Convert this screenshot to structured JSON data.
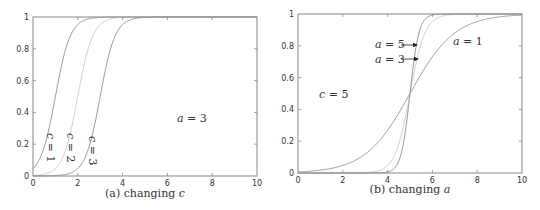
{
  "chart_data": [
    {
      "type": "line",
      "title": "",
      "caption": "(a) changing c",
      "caption_prefix": "(a) changing ",
      "caption_var": "c",
      "xlabel": "",
      "ylabel": "",
      "xlim": [
        0,
        10
      ],
      "ylim": [
        0,
        1
      ],
      "xticks": [
        "0",
        "2",
        "4",
        "6",
        "8",
        "10"
      ],
      "yticks": [
        "0",
        "0.2",
        "0.4",
        "0.6",
        "0.8",
        "1"
      ],
      "grid": false,
      "function": "1/(1+exp(-a*(x-c)))",
      "series": [
        {
          "name": "c = 1",
          "a": 3,
          "c": 1,
          "color": "#9a9a9a"
        },
        {
          "name": "c = 2",
          "a": 3,
          "c": 2,
          "color": "#d0d0d0"
        },
        {
          "name": "c = 3",
          "a": 3,
          "c": 3,
          "color": "#9a9a9a"
        }
      ],
      "annotations": [
        {
          "text": "c = 1",
          "rotated": true
        },
        {
          "text": "c = 2",
          "rotated": true
        },
        {
          "text": "c = 3",
          "rotated": true
        },
        {
          "text": "a = 3",
          "rotated": false
        }
      ]
    },
    {
      "type": "line",
      "title": "",
      "caption": "(b) changing a",
      "caption_prefix": "(b) changing ",
      "caption_var": "a",
      "xlabel": "",
      "ylabel": "",
      "xlim": [
        0,
        10
      ],
      "ylim": [
        0,
        1
      ],
      "xticks": [
        "0",
        "2",
        "4",
        "6",
        "8",
        "10"
      ],
      "yticks": [
        "0",
        "0.2",
        "0.4",
        "0.6",
        "0.8",
        "1"
      ],
      "grid": false,
      "function": "1/(1+exp(-a*(x-c)))",
      "series": [
        {
          "name": "a = 1",
          "a": 1,
          "c": 5,
          "color": "#9a9a9a"
        },
        {
          "name": "a = 3",
          "a": 3,
          "c": 5,
          "color": "#d0d0d0"
        },
        {
          "name": "a = 5",
          "a": 5,
          "c": 5,
          "color": "#9a9a9a"
        }
      ],
      "annotations": [
        {
          "text": "a = 5",
          "arrow": true
        },
        {
          "text": "a = 3",
          "arrow": true
        },
        {
          "text": "a = 1",
          "arrow": false
        },
        {
          "text": "c = 5",
          "arrow": false
        }
      ]
    }
  ]
}
